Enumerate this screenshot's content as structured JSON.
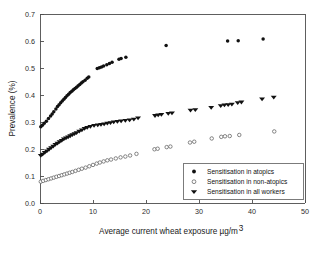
{
  "chart_data": {
    "type": "scatter",
    "title": "",
    "xlabel": "Average current wheat exposure µg/m³",
    "xlabel_main": "Average current wheat exposure µg/m",
    "xlabel_sup": "3",
    "ylabel": "Prevalence (%)",
    "xlim": [
      0,
      50
    ],
    "ylim": [
      0,
      0.7
    ],
    "xticks": [
      0,
      10,
      20,
      30,
      40,
      50
    ],
    "xticklabels": [
      "0",
      "10",
      "20",
      "30",
      "40",
      "50"
    ],
    "yticks": [
      0.0,
      0.1,
      0.2,
      0.3,
      0.4,
      0.5,
      0.6,
      0.7
    ],
    "yticklabels": [
      "0.0",
      "0.1",
      "0.2",
      "0.3",
      "0.4",
      "0.5",
      "0.6",
      "0.7"
    ],
    "grid": false,
    "legend_position": "lower right",
    "series": [
      {
        "name": "Sensitisation in atopics",
        "marker": "filled-circle",
        "color": "#111111",
        "points": [
          [
            0.15,
            0.282
          ],
          [
            0.45,
            0.288
          ],
          [
            0.8,
            0.295
          ],
          [
            1.2,
            0.303
          ],
          [
            1.6,
            0.313
          ],
          [
            2.0,
            0.322
          ],
          [
            2.3,
            0.33
          ],
          [
            2.6,
            0.338
          ],
          [
            3.0,
            0.348
          ],
          [
            3.3,
            0.357
          ],
          [
            3.6,
            0.364
          ],
          [
            3.9,
            0.371
          ],
          [
            4.2,
            0.378
          ],
          [
            4.5,
            0.384
          ],
          [
            4.8,
            0.391
          ],
          [
            5.1,
            0.397
          ],
          [
            5.4,
            0.403
          ],
          [
            5.7,
            0.409
          ],
          [
            6.0,
            0.414
          ],
          [
            6.3,
            0.419
          ],
          [
            6.6,
            0.424
          ],
          [
            6.9,
            0.429
          ],
          [
            7.2,
            0.434
          ],
          [
            7.5,
            0.439
          ],
          [
            7.8,
            0.444
          ],
          [
            8.1,
            0.449
          ],
          [
            8.5,
            0.455
          ],
          [
            8.9,
            0.462
          ],
          [
            9.2,
            0.467
          ],
          [
            10.8,
            0.498
          ],
          [
            11.2,
            0.501
          ],
          [
            11.6,
            0.504
          ],
          [
            12.0,
            0.507
          ],
          [
            12.6,
            0.512
          ],
          [
            13.1,
            0.517
          ],
          [
            13.6,
            0.521
          ],
          [
            14.9,
            0.532
          ],
          [
            15.3,
            0.535
          ],
          [
            16.2,
            0.54
          ],
          [
            23.8,
            0.583
          ],
          [
            35.4,
            0.6
          ],
          [
            37.4,
            0.601
          ],
          [
            42.1,
            0.607
          ]
        ]
      },
      {
        "name": "Sensitisation in non-atopics",
        "marker": "open-circle",
        "color": "#555555",
        "points": [
          [
            0.15,
            0.079
          ],
          [
            0.6,
            0.082
          ],
          [
            1.1,
            0.085
          ],
          [
            1.6,
            0.088
          ],
          [
            2.1,
            0.091
          ],
          [
            2.6,
            0.094
          ],
          [
            3.1,
            0.097
          ],
          [
            3.6,
            0.1
          ],
          [
            4.1,
            0.103
          ],
          [
            4.6,
            0.106
          ],
          [
            5.1,
            0.109
          ],
          [
            5.6,
            0.112
          ],
          [
            6.1,
            0.115
          ],
          [
            6.7,
            0.119
          ],
          [
            7.3,
            0.123
          ],
          [
            7.9,
            0.127
          ],
          [
            8.6,
            0.131
          ],
          [
            9.3,
            0.136
          ],
          [
            10.0,
            0.141
          ],
          [
            10.7,
            0.146
          ],
          [
            11.3,
            0.15
          ],
          [
            12.0,
            0.154
          ],
          [
            12.7,
            0.158
          ],
          [
            13.4,
            0.161
          ],
          [
            14.3,
            0.165
          ],
          [
            15.2,
            0.169
          ],
          [
            16.1,
            0.172
          ],
          [
            17.0,
            0.176
          ],
          [
            18.2,
            0.182
          ],
          [
            21.6,
            0.199
          ],
          [
            22.2,
            0.201
          ],
          [
            23.9,
            0.207
          ],
          [
            24.6,
            0.209
          ],
          [
            28.3,
            0.224
          ],
          [
            29.1,
            0.227
          ],
          [
            32.4,
            0.239
          ],
          [
            34.2,
            0.245
          ],
          [
            34.9,
            0.247
          ],
          [
            35.8,
            0.248
          ],
          [
            37.6,
            0.252
          ],
          [
            44.2,
            0.265
          ]
        ]
      },
      {
        "name": "Sensitisation in all workers",
        "marker": "filled-triangle-down",
        "color": "#111111",
        "points": [
          [
            0.15,
            0.175
          ],
          [
            0.5,
            0.18
          ],
          [
            0.9,
            0.186
          ],
          [
            1.3,
            0.192
          ],
          [
            1.7,
            0.198
          ],
          [
            2.1,
            0.204
          ],
          [
            2.5,
            0.21
          ],
          [
            2.9,
            0.216
          ],
          [
            3.3,
            0.221
          ],
          [
            3.7,
            0.226
          ],
          [
            4.1,
            0.231
          ],
          [
            4.5,
            0.236
          ],
          [
            4.9,
            0.24
          ],
          [
            5.3,
            0.244
          ],
          [
            5.7,
            0.248
          ],
          [
            6.1,
            0.252
          ],
          [
            6.5,
            0.256
          ],
          [
            6.9,
            0.26
          ],
          [
            7.4,
            0.265
          ],
          [
            7.9,
            0.27
          ],
          [
            8.4,
            0.275
          ],
          [
            8.9,
            0.279
          ],
          [
            9.5,
            0.283
          ],
          [
            10.2,
            0.286
          ],
          [
            10.9,
            0.288
          ],
          [
            11.5,
            0.29
          ],
          [
            12.1,
            0.292
          ],
          [
            12.7,
            0.295
          ],
          [
            13.3,
            0.297
          ],
          [
            13.9,
            0.299
          ],
          [
            14.6,
            0.301
          ],
          [
            15.3,
            0.303
          ],
          [
            16.1,
            0.305
          ],
          [
            16.9,
            0.307
          ],
          [
            17.7,
            0.31
          ],
          [
            18.5,
            0.314
          ],
          [
            21.7,
            0.323
          ],
          [
            22.3,
            0.325
          ],
          [
            22.9,
            0.327
          ],
          [
            24.2,
            0.331
          ],
          [
            24.9,
            0.333
          ],
          [
            28.4,
            0.343
          ],
          [
            29.3,
            0.345
          ],
          [
            32.3,
            0.353
          ],
          [
            34.1,
            0.36
          ],
          [
            34.8,
            0.362
          ],
          [
            35.5,
            0.363
          ],
          [
            36.2,
            0.365
          ],
          [
            37.3,
            0.371
          ],
          [
            38.0,
            0.373
          ],
          [
            41.9,
            0.385
          ],
          [
            44.1,
            0.391
          ]
        ]
      }
    ]
  },
  "legend": {
    "items": [
      {
        "label": "Sensitisation in atopics",
        "marker": "filled-circle"
      },
      {
        "label": "Sensitisation in non-atopics",
        "marker": "open-circle"
      },
      {
        "label": "Sensitisation in all workers",
        "marker": "filled-triangle-down"
      }
    ]
  }
}
